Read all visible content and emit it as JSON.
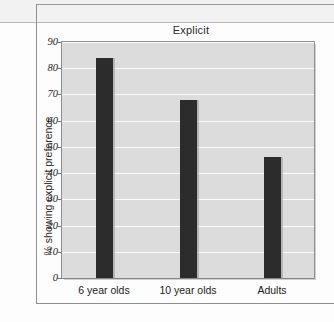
{
  "chart_data": {
    "type": "bar",
    "title": "Explicit",
    "xlabel": "",
    "ylabel": "% showing explicit preference",
    "categories": [
      "6 year olds",
      "10 year olds",
      "Adults"
    ],
    "values": [
      84,
      68,
      46
    ],
    "ylim": [
      0,
      90
    ],
    "ytick_labels": [
      "0",
      "10",
      "20",
      "30",
      "40",
      "50",
      "60",
      "70",
      "80",
      "90"
    ],
    "ytick_values": [
      0,
      10,
      20,
      30,
      40,
      50,
      60,
      70,
      80,
      90
    ],
    "grid": true,
    "legend": false,
    "bar_color": "#2c2c2c",
    "plot_background": "#dcdcdc",
    "gridline_color": "#fbfbfb"
  }
}
